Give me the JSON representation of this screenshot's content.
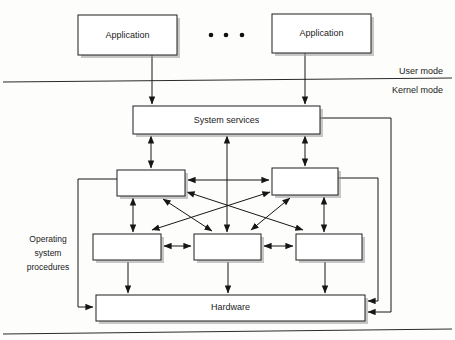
{
  "diagram": {
    "canvas": {
      "width": 455,
      "height": 340,
      "background": "#fdfdfc"
    },
    "colors": {
      "box_fill": "#ffffff",
      "box_stroke": "#1f1f1f",
      "shadow": "#9a9a9a",
      "line": "#161616",
      "text": "#1b1b1b"
    },
    "mode_labels": {
      "user": "User mode",
      "kernel": "Kernel mode"
    },
    "side_label": {
      "line1": "Operating",
      "line2": "system",
      "line3": "procedures"
    },
    "ellipsis": {
      "symbol": "•",
      "count": 3
    },
    "boxes": [
      {
        "id": "app-left",
        "label": "Application",
        "x": 78,
        "y": 15,
        "w": 99,
        "h": 40
      },
      {
        "id": "app-right",
        "label": "Application",
        "x": 272,
        "y": 14,
        "w": 99,
        "h": 39
      },
      {
        "id": "system-services",
        "label": "System services",
        "x": 133,
        "y": 106,
        "w": 187,
        "h": 28
      },
      {
        "id": "proc-top-left",
        "label": "",
        "x": 117,
        "y": 170,
        "w": 68,
        "h": 26
      },
      {
        "id": "proc-top-right",
        "label": "",
        "x": 272,
        "y": 168,
        "w": 66,
        "h": 27
      },
      {
        "id": "proc-bot-left",
        "label": "",
        "x": 93,
        "y": 234,
        "w": 68,
        "h": 26
      },
      {
        "id": "proc-bot-mid",
        "label": "",
        "x": 194,
        "y": 234,
        "w": 67,
        "h": 26
      },
      {
        "id": "proc-bot-right",
        "label": "",
        "x": 296,
        "y": 234,
        "w": 66,
        "h": 26
      },
      {
        "id": "hardware",
        "label": "Hardware",
        "x": 96,
        "y": 295,
        "w": 269,
        "h": 26
      }
    ],
    "connections": [
      {
        "id": "app-left-to-services",
        "type": "arrow-down",
        "from": "app-left",
        "to": "system-services"
      },
      {
        "id": "app-right-to-services",
        "type": "arrow-down",
        "from": "app-right",
        "to": "system-services"
      },
      {
        "id": "services-to-top-left",
        "type": "double-vertical",
        "from": "system-services",
        "to": "proc-top-left"
      },
      {
        "id": "services-to-bot-mid",
        "type": "double-vertical",
        "from": "system-services",
        "to": "proc-bot-mid"
      },
      {
        "id": "services-to-top-right",
        "type": "double-vertical",
        "from": "system-services",
        "to": "proc-top-right"
      },
      {
        "id": "top-left-to-top-right",
        "type": "double-horizontal",
        "from": "proc-top-left",
        "to": "proc-top-right"
      },
      {
        "id": "top-left-to-bot-left",
        "type": "double-vertical",
        "from": "proc-top-left",
        "to": "proc-bot-left"
      },
      {
        "id": "top-right-to-bot-right",
        "type": "double-vertical",
        "from": "proc-top-right",
        "to": "proc-bot-right"
      },
      {
        "id": "top-left-to-bot-mid",
        "type": "double-diagonal",
        "from": "proc-top-left",
        "to": "proc-bot-mid"
      },
      {
        "id": "top-left-to-bot-right",
        "type": "double-diagonal",
        "from": "proc-top-left",
        "to": "proc-bot-right"
      },
      {
        "id": "top-right-to-bot-mid",
        "type": "double-diagonal",
        "from": "proc-top-right",
        "to": "proc-bot-mid"
      },
      {
        "id": "top-right-to-bot-left",
        "type": "double-diagonal",
        "from": "proc-top-right",
        "to": "proc-bot-left"
      },
      {
        "id": "bot-left-to-bot-mid",
        "type": "double-horizontal",
        "from": "proc-bot-left",
        "to": "proc-bot-mid"
      },
      {
        "id": "bot-mid-to-bot-right",
        "type": "double-horizontal",
        "from": "proc-bot-mid",
        "to": "proc-bot-right"
      },
      {
        "id": "bot-left-to-hardware",
        "type": "arrow-down",
        "from": "proc-bot-left",
        "to": "hardware"
      },
      {
        "id": "bot-mid-to-hardware",
        "type": "arrow-down",
        "from": "proc-bot-mid",
        "to": "hardware"
      },
      {
        "id": "bot-right-to-hardware",
        "type": "arrow-down",
        "from": "proc-bot-right",
        "to": "hardware"
      },
      {
        "id": "top-left-left-route-hardware",
        "type": "routed-left",
        "from": "proc-top-left",
        "to": "hardware"
      },
      {
        "id": "top-right-right-route-hw",
        "type": "routed-right",
        "from": "proc-top-right",
        "to": "hardware"
      },
      {
        "id": "services-right-route-hw",
        "type": "routed-right-far",
        "from": "system-services",
        "to": "hardware"
      }
    ]
  }
}
